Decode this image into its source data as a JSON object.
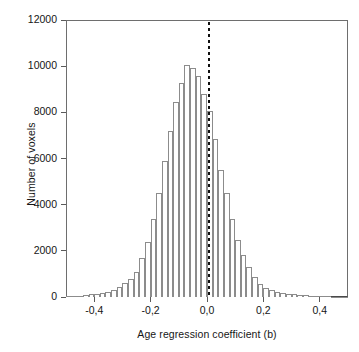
{
  "figure": {
    "background_color": "#ffffff",
    "frame_color": "#6e6e6e",
    "bar_edge_color": "#8c8c8c",
    "bar_fill_color": "#ffffff",
    "zero_line_color": "#101010"
  },
  "chart_data": {
    "type": "bar",
    "title": "",
    "xlabel": "Age regression coefficient (b)",
    "ylabel": "Number of voxels",
    "xlim": [
      -0.5,
      0.5
    ],
    "ylim": [
      0,
      12000
    ],
    "grid": false,
    "legend": null,
    "bin_width": 0.02,
    "annotations": [
      {
        "type": "vertical-dotted-line",
        "x": 0.0,
        "label": "zero reference"
      }
    ],
    "xticklabels": [
      "-0,4",
      "-0,2",
      "0,0",
      "0,2",
      "0,4"
    ],
    "xtickvalues": [
      -0.4,
      -0.2,
      0.0,
      0.2,
      0.4
    ],
    "yticklabels": [
      "0",
      "2000",
      "4000",
      "6000",
      "8000",
      "10000",
      "12000"
    ],
    "ytickvalues": [
      0,
      2000,
      4000,
      6000,
      8000,
      10000,
      12000
    ],
    "categories": [
      -0.49,
      -0.47,
      -0.45,
      -0.43,
      -0.41,
      -0.39,
      -0.37,
      -0.35,
      -0.33,
      -0.31,
      -0.29,
      -0.27,
      -0.25,
      -0.23,
      -0.21,
      -0.19,
      -0.17,
      -0.15,
      -0.13,
      -0.11,
      -0.09,
      -0.07,
      -0.05,
      -0.03,
      -0.01,
      0.01,
      0.03,
      0.05,
      0.07,
      0.09,
      0.11,
      0.13,
      0.15,
      0.17,
      0.19,
      0.21,
      0.23,
      0.25,
      0.27,
      0.29,
      0.31,
      0.33,
      0.35,
      0.37,
      0.39,
      0.41,
      0.43,
      0.45,
      0.47,
      0.49
    ],
    "values": [
      30,
      40,
      60,
      70,
      110,
      130,
      170,
      230,
      300,
      420,
      600,
      760,
      1100,
      1700,
      2400,
      3370,
      4500,
      5880,
      7180,
      8450,
      9290,
      10070,
      9900,
      9580,
      8800,
      8060,
      6850,
      5490,
      4490,
      3360,
      2490,
      1820,
      1290,
      860,
      560,
      380,
      290,
      230,
      180,
      140,
      110,
      90,
      70,
      55,
      45,
      35,
      28,
      20,
      15,
      10
    ]
  }
}
